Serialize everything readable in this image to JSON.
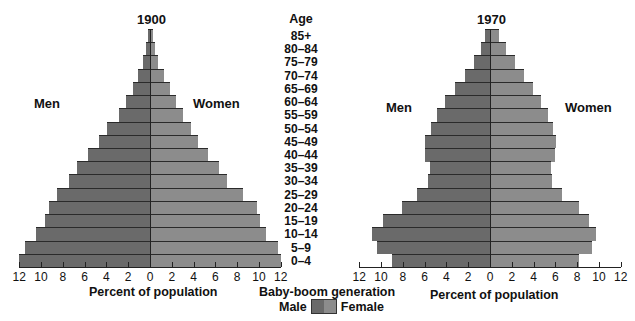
{
  "chart_data": [
    {
      "type": "bar",
      "subtype": "population-pyramid",
      "title": "1900",
      "xlabel": "Percent of population",
      "left_label": "Men",
      "right_label": "Women",
      "xlim": [
        12,
        12
      ],
      "x_ticks": [
        12,
        10,
        8,
        6,
        4,
        2,
        0,
        2,
        4,
        6,
        8,
        10,
        12
      ],
      "categories": [
        "85+",
        "80–84",
        "75–79",
        "70–74",
        "65–69",
        "60–64",
        "55–59",
        "50–54",
        "45–49",
        "40–44",
        "35–39",
        "30–34",
        "25–29",
        "20–24",
        "15–19",
        "10–14",
        "5–9",
        "0–4"
      ],
      "series": [
        {
          "name": "Male",
          "values": [
            0.2,
            0.4,
            0.6,
            1.1,
            1.6,
            2.2,
            2.8,
            3.9,
            4.7,
            5.7,
            6.7,
            7.4,
            8.5,
            9.3,
            9.6,
            10.5,
            11.5,
            12.0
          ]
        },
        {
          "name": "Female",
          "values": [
            0.3,
            0.5,
            0.7,
            1.3,
            1.8,
            2.4,
            3.0,
            3.8,
            4.4,
            5.3,
            6.3,
            7.1,
            8.5,
            9.8,
            10.1,
            10.6,
            11.7,
            12.0
          ]
        }
      ]
    },
    {
      "type": "bar",
      "subtype": "population-pyramid",
      "title": "1970",
      "xlabel": "Percent of population",
      "left_label": "Men",
      "right_label": "Women",
      "xlim": [
        12,
        12
      ],
      "x_ticks": [
        12,
        10,
        8,
        6,
        4,
        2,
        0,
        2,
        4,
        6,
        8,
        10,
        12
      ],
      "categories": [
        "85+",
        "80–84",
        "75–79",
        "70–74",
        "65–69",
        "60–64",
        "55–59",
        "50–54",
        "45–49",
        "40–44",
        "35–39",
        "30–34",
        "25–29",
        "20–24",
        "15–19",
        "10–14",
        "5–9",
        "0–4"
      ],
      "series": [
        {
          "name": "Male",
          "values": [
            0.5,
            0.8,
            1.5,
            2.3,
            3.2,
            4.1,
            4.9,
            5.4,
            6.0,
            6.0,
            5.5,
            5.7,
            6.7,
            8.1,
            9.8,
            10.8,
            10.4,
            9.0
          ]
        },
        {
          "name": "Female",
          "values": [
            0.8,
            1.5,
            2.3,
            3.1,
            3.9,
            4.7,
            5.3,
            5.8,
            6.1,
            6.0,
            5.6,
            5.7,
            6.6,
            8.2,
            9.1,
            9.7,
            9.4,
            8.2
          ]
        }
      ]
    }
  ],
  "center": {
    "age_header": "Age",
    "ages": [
      "85+",
      "80–84",
      "75–79",
      "70–74",
      "65–69",
      "60–64",
      "55–59",
      "50–54",
      "45–49",
      "40–44",
      "35–39",
      "30–34",
      "25–29",
      "20–24",
      "15–19",
      "10–14",
      "5–9",
      "0–4"
    ]
  },
  "legend": {
    "title": "Baby-boom generation",
    "male_label": "Male",
    "female_label": "Female",
    "male_color": "#6a6a6a",
    "female_color": "#8c8c8c"
  },
  "left": {
    "title": "1900",
    "men": "Men",
    "women": "Women",
    "xlabel": "Percent of population"
  },
  "right": {
    "title": "1970",
    "men": "Men",
    "women": "Women",
    "xlabel": "Percent of population"
  }
}
